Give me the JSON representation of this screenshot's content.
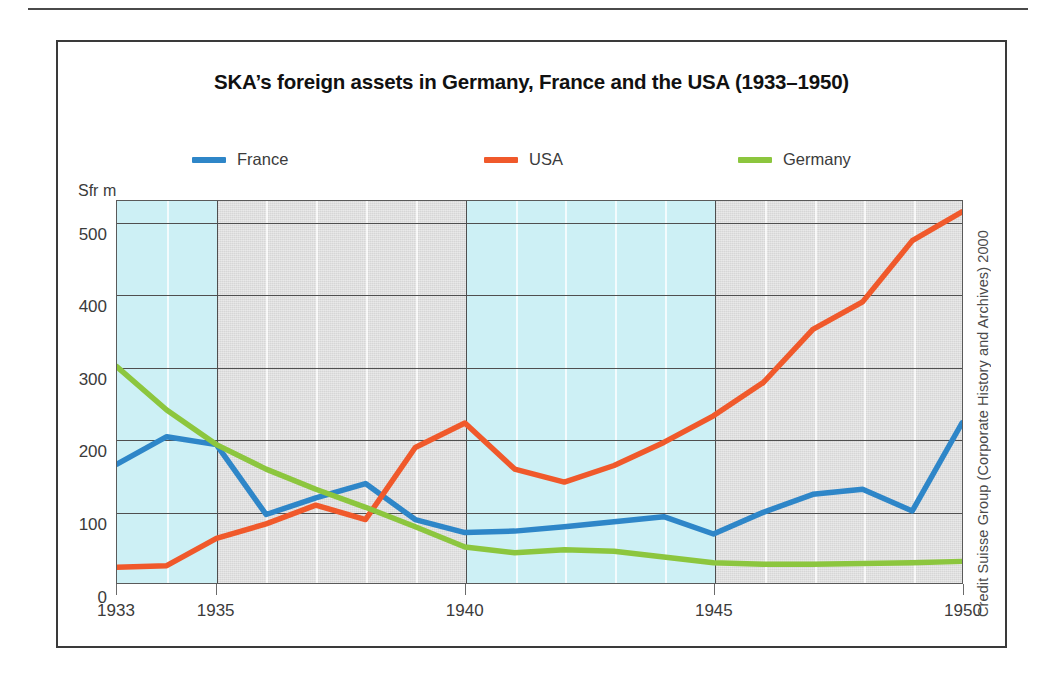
{
  "figure": {
    "title": "SKA’s foreign assets in Germany, France and the USA (1933–1950)",
    "credit": "Credit Suisse Group (Corporate History and Archives) 2000",
    "unit_label": "Sfr m"
  },
  "colors": {
    "france": "#2E86C8",
    "usa": "#F0592B",
    "germany": "#8CC63E",
    "band_blue": "#CDF0F5",
    "band_gray": "#D6D6D6",
    "grid": "#4F4F4F",
    "frame": "#3A3A3A",
    "text": "#3B3B3B"
  },
  "legend": {
    "position": "top",
    "items": [
      {
        "label": "France",
        "color": "#2E86C8"
      },
      {
        "label": "USA",
        "color": "#F0592B"
      },
      {
        "label": "Germany",
        "color": "#8CC63E"
      }
    ]
  },
  "bands": [
    {
      "from": 1933,
      "to": 1935,
      "shade": "blue"
    },
    {
      "from": 1935,
      "to": 1940,
      "shade": "gray"
    },
    {
      "from": 1940,
      "to": 1945,
      "shade": "blue"
    },
    {
      "from": 1945,
      "to": 1950,
      "shade": "gray"
    }
  ],
  "chart_data": {
    "type": "line",
    "title": "SKA’s foreign assets in Germany, France and the USA (1933–1950)",
    "xlabel": "",
    "ylabel": "Sfr m",
    "xlim": [
      1933,
      1950
    ],
    "ylim": [
      0,
      530
    ],
    "grid": true,
    "legend_position": "top",
    "x": [
      1933,
      1934,
      1935,
      1936,
      1937,
      1938,
      1939,
      1940,
      1941,
      1942,
      1943,
      1944,
      1945,
      1946,
      1947,
      1948,
      1949,
      1950
    ],
    "xticks": [
      1933,
      1935,
      1940,
      1945,
      1950
    ],
    "xtick_labels": [
      "1933",
      "1935",
      "1940",
      "1945",
      "1950"
    ],
    "yticks": [
      0,
      100,
      200,
      300,
      400,
      500
    ],
    "ytick_labels": [
      "0",
      "100",
      "200",
      "300",
      "400",
      "500"
    ],
    "series": [
      {
        "name": "France",
        "color": "#2E86C8",
        "values": [
          165,
          203,
          192,
          95,
          118,
          138,
          88,
          70,
          72,
          78,
          85,
          92,
          68,
          98,
          123,
          130,
          100,
          222
        ]
      },
      {
        "name": "USA",
        "color": "#F0592B",
        "values": [
          22,
          24,
          62,
          82,
          108,
          88,
          188,
          222,
          158,
          140,
          163,
          195,
          232,
          278,
          352,
          390,
          475,
          515
        ]
      },
      {
        "name": "Germany",
        "color": "#8CC63E",
        "values": [
          300,
          240,
          192,
          158,
          130,
          105,
          78,
          50,
          42,
          46,
          44,
          36,
          28,
          26,
          26,
          27,
          28,
          30
        ]
      }
    ]
  }
}
